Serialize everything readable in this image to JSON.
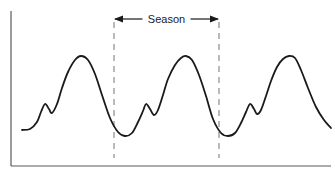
{
  "figure": {
    "width": 335,
    "height": 177,
    "background_color": "#ffffff"
  },
  "annotation": {
    "season_label": "Season",
    "arrow_style": "double-headed",
    "left_marker_x": 114,
    "right_marker_x": 219,
    "label_y": 19
  },
  "axes": {
    "line_color": "#5a5a5a",
    "y_axis": {
      "x": 11,
      "y_top": 11,
      "y_bottom": 166
    },
    "x_axis": {
      "y": 166,
      "x_left": 11,
      "x_right": 331
    },
    "show_ticks": false,
    "xlabel": "",
    "ylabel": ""
  },
  "style": {
    "curve_color": "#1a1a1a",
    "curve_width": 1.8,
    "dashed_line_color": "#8c8c8c",
    "dashed_pattern": "6 5",
    "arrow_color": "#1a1a1a"
  },
  "chart_data": {
    "type": "line",
    "title": "",
    "subtitle": "",
    "xlabel": "",
    "ylabel": "",
    "legend": [],
    "grid": false,
    "xlim": [
      0,
      1
    ],
    "ylim": [
      0,
      1
    ],
    "annotations": [
      {
        "text": "Season",
        "type": "span-arrow",
        "from_x": 114,
        "to_x": 219,
        "y": 19
      },
      {
        "type": "vertical-dashed-line",
        "x": 114,
        "y_top": 22,
        "y_bottom": 158
      },
      {
        "type": "vertical-dashed-line",
        "x": 219,
        "y_top": 22,
        "y_bottom": 158
      }
    ],
    "cycles": 3,
    "season_period_px": 105,
    "series": [
      {
        "name": "seasonal series",
        "color": "#1a1a1a",
        "points": [
          [
            22,
            130
          ],
          [
            30,
            129
          ],
          [
            37,
            122
          ],
          [
            41,
            112
          ],
          [
            45,
            104
          ],
          [
            49,
            109
          ],
          [
            52,
            113
          ],
          [
            57,
            104
          ],
          [
            62,
            88
          ],
          [
            68,
            72
          ],
          [
            75,
            60
          ],
          [
            81,
            56
          ],
          [
            88,
            60
          ],
          [
            95,
            74
          ],
          [
            102,
            95
          ],
          [
            110,
            118
          ],
          [
            118,
            132
          ],
          [
            125,
            136
          ],
          [
            132,
            133
          ],
          [
            138,
            122
          ],
          [
            143,
            111
          ],
          [
            146,
            104
          ],
          [
            150,
            109
          ],
          [
            154,
            115
          ],
          [
            158,
            110
          ],
          [
            163,
            95
          ],
          [
            168,
            79
          ],
          [
            175,
            65
          ],
          [
            181,
            58
          ],
          [
            186,
            56
          ],
          [
            192,
            60
          ],
          [
            199,
            75
          ],
          [
            206,
            96
          ],
          [
            213,
            119
          ],
          [
            221,
            133
          ],
          [
            228,
            136
          ],
          [
            235,
            133
          ],
          [
            241,
            123
          ],
          [
            246,
            112
          ],
          [
            250,
            104
          ],
          [
            254,
            109
          ],
          [
            257,
            114
          ],
          [
            261,
            110
          ],
          [
            266,
            96
          ],
          [
            271,
            81
          ],
          [
            277,
            67
          ],
          [
            283,
            59
          ],
          [
            289,
            56
          ],
          [
            295,
            58
          ],
          [
            301,
            70
          ],
          [
            308,
            88
          ],
          [
            316,
            107
          ],
          [
            324,
            120
          ],
          [
            331,
            128
          ]
        ]
      }
    ]
  }
}
